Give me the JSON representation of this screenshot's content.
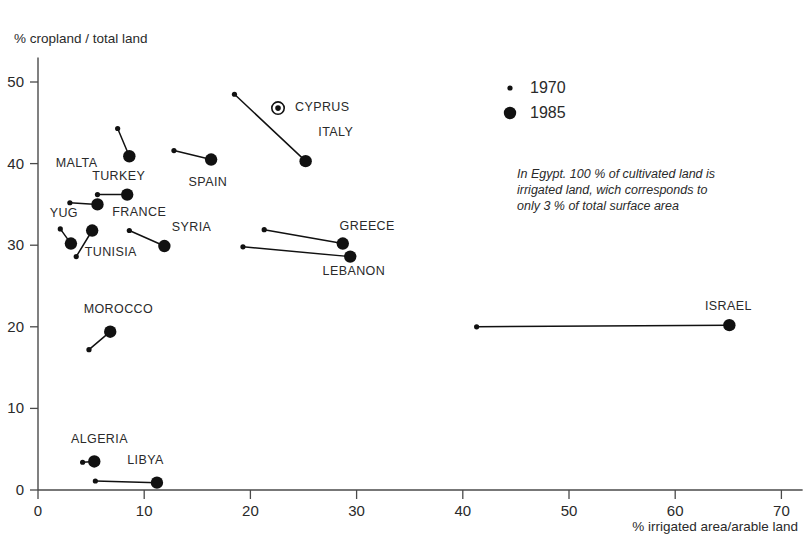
{
  "chart_data": {
    "type": "scatter",
    "title": "",
    "xlabel": "% irrigated area/arable land",
    "ylabel": "% cropland / total land",
    "xlim": [
      0,
      72
    ],
    "ylim": [
      0,
      53
    ],
    "xticks": [
      0,
      10,
      20,
      30,
      40,
      50,
      60,
      70
    ],
    "yticks": [
      0,
      10,
      20,
      30,
      40,
      50
    ],
    "grid": false,
    "legend_position": "top-right",
    "series": [
      {
        "name": "1970",
        "marker": "small-dot"
      },
      {
        "name": "1985",
        "marker": "large-dot"
      }
    ],
    "points": [
      {
        "label": "MALTA",
        "x_1970": 7.5,
        "y_1970": 44.3,
        "x_1985": 8.6,
        "y_1985": 40.9,
        "label_x": 5.6,
        "label_y": 39.6,
        "anchor": "end"
      },
      {
        "label": "SPAIN",
        "x_1970": 12.8,
        "y_1970": 41.6,
        "x_1985": 16.3,
        "y_1985": 40.5,
        "label_x": 16.0,
        "label_y": 37.2,
        "anchor": "middle"
      },
      {
        "label": "ITALY",
        "x_1970": 18.5,
        "y_1970": 48.5,
        "x_1985": 25.2,
        "y_1985": 40.3,
        "label_x": 26.4,
        "label_y": 43.4,
        "anchor": "start"
      },
      {
        "label": "CYPRUS",
        "x_1970": null,
        "y_1970": null,
        "x_1985": 22.6,
        "y_1985": 46.8,
        "label_x": 24.2,
        "label_y": 46.4,
        "anchor": "start",
        "marker": "ringed-dot"
      },
      {
        "label": "TURKEY",
        "x_1970": 5.6,
        "y_1970": 36.2,
        "x_1985": 8.4,
        "y_1985": 36.2,
        "label_x": 7.6,
        "label_y": 38.0,
        "anchor": "middle"
      },
      {
        "label": "FRANCE",
        "x_1970": 3.0,
        "y_1970": 35.2,
        "x_1985": 5.6,
        "y_1985": 35.0,
        "label_x": 7.0,
        "label_y": 33.6,
        "anchor": "start"
      },
      {
        "label": "YUG",
        "x_1970": 2.1,
        "y_1970": 32.0,
        "x_1985": 3.1,
        "y_1985": 30.2,
        "label_x": 1.1,
        "label_y": 33.4,
        "anchor": "start"
      },
      {
        "label": "TUNISIA",
        "x_1970": 3.6,
        "y_1970": 28.6,
        "x_1985": 5.1,
        "y_1985": 31.8,
        "label_x": 4.4,
        "label_y": 28.7,
        "anchor": "start"
      },
      {
        "label": "SYRIA",
        "x_1970": 8.6,
        "y_1970": 31.8,
        "x_1985": 11.9,
        "y_1985": 29.9,
        "label_x": 12.6,
        "label_y": 31.8,
        "anchor": "start"
      },
      {
        "label": "GREECE",
        "x_1970": 21.3,
        "y_1970": 31.9,
        "x_1985": 28.7,
        "y_1985": 30.2,
        "label_x": 28.4,
        "label_y": 31.9,
        "anchor": "start"
      },
      {
        "label": "LEBANON",
        "x_1970": 19.3,
        "y_1970": 29.8,
        "x_1985": 29.4,
        "y_1985": 28.6,
        "label_x": 26.8,
        "label_y": 26.4,
        "anchor": "start"
      },
      {
        "label": "ISRAEL",
        "x_1970": 41.3,
        "y_1970": 20.0,
        "x_1985": 65.1,
        "y_1985": 20.2,
        "label_x": 62.8,
        "label_y": 22.0,
        "anchor": "start"
      },
      {
        "label": "MOROCCO",
        "x_1970": 4.8,
        "y_1970": 17.2,
        "x_1985": 6.8,
        "y_1985": 19.4,
        "label_x": 4.3,
        "label_y": 21.7,
        "anchor": "start"
      },
      {
        "label": "ALGERIA",
        "x_1970": 4.2,
        "y_1970": 3.4,
        "x_1985": 5.3,
        "y_1985": 3.5,
        "label_x": 3.1,
        "label_y": 5.7,
        "anchor": "start"
      },
      {
        "label": "LIBYA",
        "x_1970": 5.4,
        "y_1970": 1.1,
        "x_1985": 11.2,
        "y_1985": 0.9,
        "label_x": 8.4,
        "label_y": 3.2,
        "anchor": "start"
      }
    ],
    "annotations": [
      {
        "name": "egypt-note",
        "lines": [
          "In Egypt. 100 % of cultivated land is",
          "irrigated land, wich corresponds to",
          "only 3 % of total surface area"
        ]
      }
    ]
  },
  "legend": {
    "entries": [
      {
        "label": "1970",
        "marker": "small-dot"
      },
      {
        "label": "1985",
        "marker": "large-dot"
      }
    ]
  },
  "colors": {
    "ink": "#111111",
    "axis": "#4a4a4a",
    "background": "#ffffff"
  }
}
